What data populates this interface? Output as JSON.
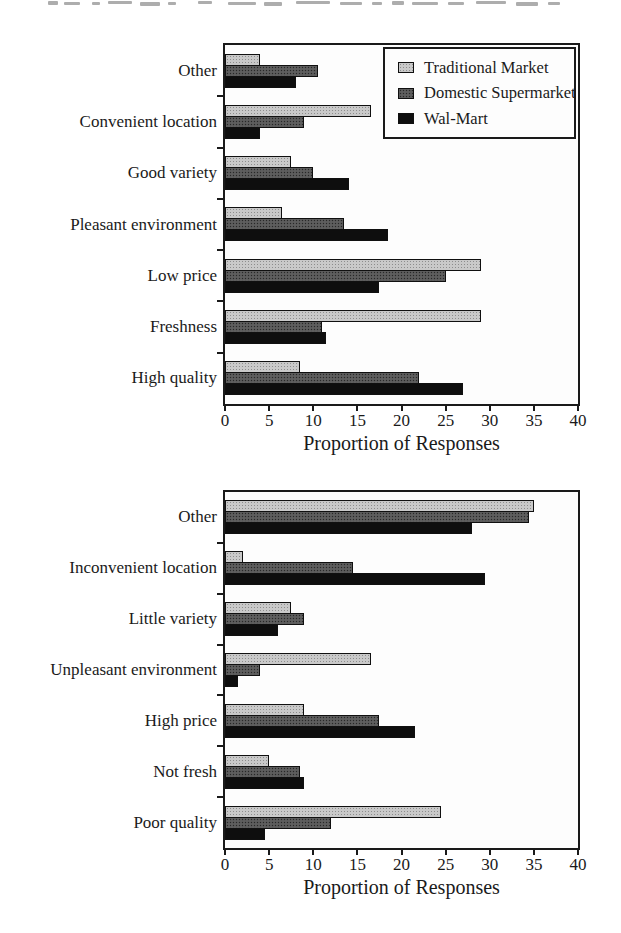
{
  "figure": {
    "background": "#ffffff",
    "axis_color": "#1a1a1a",
    "xlabel": "Proportion of Responses"
  },
  "legend": {
    "position": "upper-right-of-top-chart",
    "items": [
      {
        "label": "Traditional Market",
        "swatch": "light-gray-stipple",
        "color": "#c9c9c9"
      },
      {
        "label": "Domestic Supermarket",
        "swatch": "dark-gray-stipple",
        "color": "#585858"
      },
      {
        "label": "Wal-Mart",
        "swatch": "solid-black",
        "color": "#0e0e0e"
      }
    ]
  },
  "chart_data": [
    {
      "type": "bar",
      "orientation": "horizontal",
      "title": "",
      "xlabel": "Proportion of Responses",
      "ylabel": "",
      "xlim": [
        0,
        40
      ],
      "xticks": [
        0,
        5,
        10,
        15,
        20,
        25,
        30,
        35,
        40
      ],
      "grid": false,
      "legend_position": "upper right",
      "categories": [
        "Other",
        "Convenient location",
        "Good variety",
        "Pleasant environment",
        "Low price",
        "Freshness",
        "High quality"
      ],
      "series": [
        {
          "name": "Traditional Market",
          "values": [
            4,
            16.5,
            7.5,
            6.5,
            29,
            29,
            8.5
          ]
        },
        {
          "name": "Domestic Supermarket",
          "values": [
            10.5,
            9,
            10,
            13.5,
            25,
            11,
            22
          ]
        },
        {
          "name": "Wal-Mart",
          "values": [
            8,
            4,
            14,
            18.5,
            17.5,
            11.5,
            27
          ]
        }
      ]
    },
    {
      "type": "bar",
      "orientation": "horizontal",
      "title": "",
      "xlabel": "Proportion of Responses",
      "ylabel": "",
      "xlim": [
        0,
        40
      ],
      "xticks": [
        0,
        5,
        10,
        15,
        20,
        25,
        30,
        35,
        40
      ],
      "grid": false,
      "legend_position": "none",
      "categories": [
        "Other",
        "Inconvenient location",
        "Little variety",
        "Unpleasant environment",
        "High price",
        "Not fresh",
        "Poor quality"
      ],
      "series": [
        {
          "name": "Traditional Market",
          "values": [
            35,
            2,
            7.5,
            16.5,
            9,
            5,
            24.5
          ]
        },
        {
          "name": "Domestic Supermarket",
          "values": [
            34.5,
            14.5,
            9,
            4,
            17.5,
            8.5,
            12
          ]
        },
        {
          "name": "Wal-Mart",
          "values": [
            28,
            29.5,
            6,
            1.5,
            21.5,
            9,
            4.5
          ]
        }
      ]
    }
  ]
}
